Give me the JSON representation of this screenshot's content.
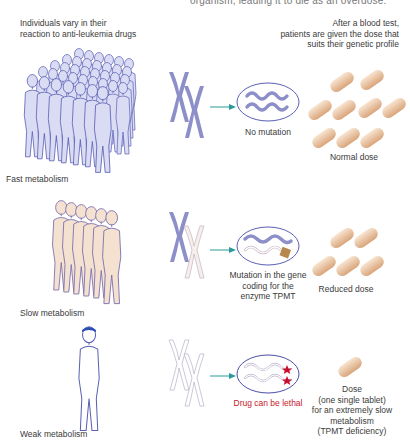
{
  "header": {
    "cut_text": "organism, leading it to die as an overdose.",
    "left_caption_line1": "Individuals vary in their",
    "left_caption_line2": "reaction to anti-leukemia drugs",
    "right_caption_line1": "After a blood test,",
    "right_caption_line2": "patients are given the dose that",
    "right_caption_line3": "suits their genetic profile"
  },
  "rows": [
    {
      "group_label": "Fast metabolism",
      "gene_label": "No mutation",
      "dose_label": "Normal dose",
      "people_count": 40,
      "tablets": 9,
      "chromosomes": "both-colored"
    },
    {
      "group_label": "Slow metabolism",
      "gene_label_line1": "Mutation in the gene",
      "gene_label_line2": "coding for the",
      "gene_label_line3": "enzyme TPMT",
      "dose_label": "Reduced dose",
      "people_count": 6,
      "tablets": 5,
      "chromosomes": "one-colored-one-outline"
    },
    {
      "group_label": "Weak metabolism",
      "gene_label": "Drug can be lethal",
      "dose_label_line1": "Dose",
      "dose_label_line2": "(one single tablet)",
      "dose_label_line3": "for an extremely slow",
      "dose_label_line4": "metabolism",
      "dose_label_line5": "(TPMT deficiency)",
      "people_count": 1,
      "tablets": 1,
      "chromosomes": "both-outline"
    }
  ],
  "colors": {
    "fast_person_fill": "#d9dcf3",
    "person_outline": "#5a5fb4",
    "slow_person_fill": "#f5e1d0",
    "chromosome": "#8c8fc8",
    "arrow": "#2a9a9a",
    "tablet_light": "#f4d7bd",
    "tablet_dark": "#d9a57b",
    "lethal_text": "#c8202a",
    "star": "#c8102e",
    "hair": "#2a4fb0"
  },
  "icons": {
    "arrow": "right-arrow-icon",
    "cell": "cell-icon",
    "chromosome": "chromosome-icon",
    "tablet": "tablet-icon",
    "person": "person-icon",
    "star": "mutation-star-icon"
  }
}
